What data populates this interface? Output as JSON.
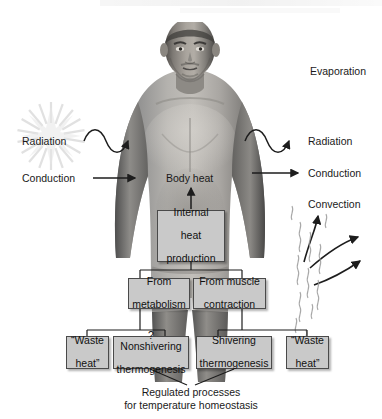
{
  "figure": {
    "background": "#ffffff",
    "box_fill": "#c9c9c9",
    "box_border": "#4a4a4a",
    "text_color": "#1a1a1a"
  },
  "labels": {
    "evaporation": "Evaporation",
    "radiation_left": "Radiation",
    "radiation_right": "Radiation",
    "conduction_left": "Conduction",
    "conduction_right": "Conduction",
    "convection_right": "Convection",
    "body_heat": "Body heat"
  },
  "boxes": {
    "internal_heat": {
      "line1": "Internal",
      "line2": "heat",
      "line3": "production"
    },
    "from_metabolism": {
      "line1": "From",
      "line2": "metabolism"
    },
    "from_muscle": {
      "line1": "From muscle",
      "line2": "contraction"
    },
    "waste_heat_left": {
      "line1": "“Waste",
      "line2": "heat”"
    },
    "nonshivering": {
      "line1": "? Nonshivering",
      "line2": "thermogenesis"
    },
    "shivering": {
      "line1": "Shivering",
      "line2": "thermogenesis"
    },
    "waste_heat_right": {
      "line1": "“Waste",
      "line2": "heat”"
    }
  },
  "caption": {
    "line1": "Regulated processes",
    "line2": "for temperature homeostasis"
  },
  "icons": {
    "sunburst": "sunburst-icon",
    "wave_in": "radiation-wave-in-icon",
    "wave_out": "radiation-wave-out-icon",
    "arrow_in": "conduction-arrow-in-icon",
    "arrow_out": "conduction-arrow-out-icon",
    "convection_arrows": "convection-arrows-icon",
    "evaporation_squiggles": "evaporation-squiggles-icon",
    "body_photo": "male-torso-photo"
  }
}
